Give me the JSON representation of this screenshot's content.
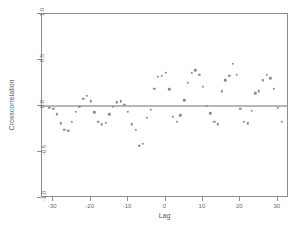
{
  "chart_data": {
    "type": "scatter",
    "title": "",
    "xlabel": "Lag",
    "ylabel": "Crosscorrelation",
    "xlim": [
      -33,
      33
    ],
    "ylim": [
      -1.0,
      1.0
    ],
    "grid": false,
    "legend": null,
    "xticks": [
      -30,
      -20,
      -10,
      0,
      10,
      20,
      30
    ],
    "xtick_labels": [
      "-30",
      "-20",
      "-10",
      "0",
      "10",
      "20",
      "30"
    ],
    "yticks": [
      -1.0,
      -0.5,
      0.0,
      0.5,
      1.0
    ],
    "ytick_labels": [
      "-1.0",
      "-0.5",
      "0.0",
      "0.5",
      "1.0"
    ],
    "reference_line_y": 0.0,
    "marker_color": "#8a8a96",
    "axis_color": "#8c8c8c",
    "series": [
      {
        "name": "crosscorrelation",
        "points": [
          [
            -31,
            -0.02
          ],
          [
            -30,
            -0.03
          ],
          [
            -29,
            -0.09
          ],
          [
            -28,
            -0.19
          ],
          [
            -27,
            -0.26
          ],
          [
            -26,
            -0.27
          ],
          [
            -25,
            -0.17
          ],
          [
            -24,
            -0.06
          ],
          [
            -23,
            -0.01
          ],
          [
            -22,
            0.08
          ],
          [
            -21,
            0.11
          ],
          [
            -20,
            0.05
          ],
          [
            -19,
            -0.07
          ],
          [
            -18,
            -0.17
          ],
          [
            -17,
            -0.2
          ],
          [
            -16,
            -0.18
          ],
          [
            -15,
            -0.09
          ],
          [
            -14,
            -0.01
          ],
          [
            -13,
            0.04
          ],
          [
            -12,
            0.05
          ],
          [
            -11,
            0.01
          ],
          [
            -10,
            -0.06
          ],
          [
            -9,
            -0.2
          ],
          [
            -8,
            -0.26
          ],
          [
            -7,
            -0.43
          ],
          [
            -6,
            -0.41
          ],
          [
            -5,
            -0.13
          ],
          [
            -4,
            -0.04
          ],
          [
            -3,
            0.19
          ],
          [
            -2,
            0.32
          ],
          [
            -1,
            0.33
          ],
          [
            0,
            0.36
          ],
          [
            1,
            0.18
          ],
          [
            2,
            -0.12
          ],
          [
            3,
            -0.17
          ],
          [
            4,
            -0.1
          ],
          [
            5,
            0.06
          ],
          [
            6,
            0.25
          ],
          [
            7,
            0.36
          ],
          [
            8,
            0.39
          ],
          [
            9,
            0.34
          ],
          [
            10,
            0.21
          ],
          [
            11,
            0.0
          ],
          [
            12,
            -0.08
          ],
          [
            13,
            -0.17
          ],
          [
            14,
            -0.2
          ],
          [
            15,
            0.16
          ],
          [
            16,
            0.28
          ],
          [
            17,
            0.33
          ],
          [
            18,
            0.46
          ],
          [
            19,
            0.34
          ],
          [
            20,
            -0.03
          ],
          [
            21,
            -0.17
          ],
          [
            22,
            -0.19
          ],
          [
            23,
            -0.05
          ],
          [
            24,
            0.14
          ],
          [
            25,
            0.16
          ],
          [
            26,
            0.28
          ],
          [
            27,
            0.34
          ],
          [
            28,
            0.3
          ],
          [
            29,
            0.19
          ],
          [
            30,
            -0.02
          ],
          [
            31,
            -0.17
          ]
        ]
      }
    ]
  }
}
